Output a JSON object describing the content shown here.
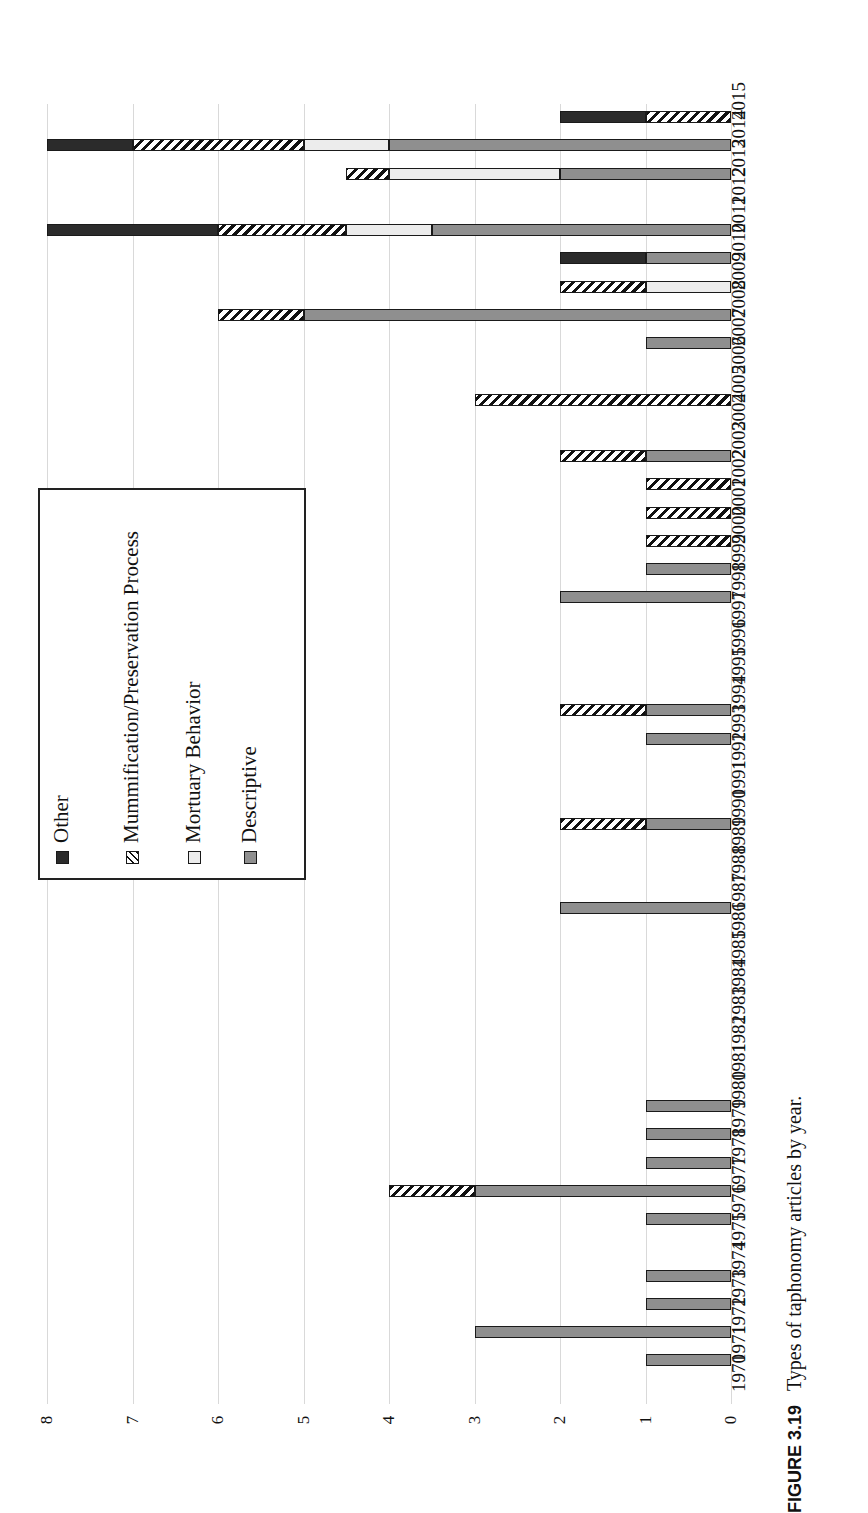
{
  "caption": {
    "figure_number": "FIGURE 3.19",
    "text": "Types of taphonomy articles by year."
  },
  "legend": {
    "items": [
      {
        "label": "Other",
        "key": "other",
        "color": "#2b2b2b"
      },
      {
        "label": "Mummification/Preservation Process",
        "key": "mummification",
        "color": "hatched"
      },
      {
        "label": "Mortuary Behavior",
        "key": "mortuary",
        "color": "#ececec"
      },
      {
        "label": "Descriptive",
        "key": "descriptive",
        "color": "#8f8f8f"
      }
    ]
  },
  "chart_data": {
    "type": "bar",
    "orientation": "horizontal-rotated",
    "title": "Types of taphonomy articles by year",
    "xlabel": "",
    "ylabel": "",
    "xlim": [
      0,
      8
    ],
    "xticks": [
      8,
      7,
      6,
      5,
      4,
      3,
      2,
      1,
      0
    ],
    "grid": true,
    "legend_position": "left-inset-box",
    "categories": [
      "2015",
      "2014",
      "2013",
      "2012",
      "2011",
      "2010",
      "2009",
      "2008",
      "2007",
      "2006",
      "2005",
      "2004",
      "2003",
      "2002",
      "2001",
      "2000",
      "1999",
      "1998",
      "1997",
      "1996",
      "1995",
      "1994",
      "1993",
      "1992",
      "1991",
      "1990",
      "1989",
      "1988",
      "1987",
      "1986",
      "1985",
      "1984",
      "1983",
      "1982",
      "1981",
      "1980",
      "1979",
      "1978",
      "1977",
      "1976",
      "1975",
      "1974",
      "1973",
      "1972",
      "1971",
      "1970"
    ],
    "series": [
      {
        "name": "Descriptive",
        "key": "descriptive",
        "values": [
          0,
          4,
          2,
          0,
          3.5,
          1,
          0,
          5,
          1,
          0,
          0,
          0,
          1,
          0,
          0,
          0,
          1,
          2,
          0,
          0,
          0,
          1,
          1,
          0,
          0,
          1,
          0,
          0,
          2,
          0,
          0,
          0,
          0,
          0,
          0,
          1,
          1,
          1,
          3,
          1,
          0,
          1,
          1,
          3,
          1,
          0
        ]
      },
      {
        "name": "Mortuary Behavior",
        "key": "mortuary",
        "values": [
          0,
          1,
          2,
          0,
          1,
          0,
          1,
          0,
          0,
          0,
          0,
          0,
          0,
          0,
          0,
          0,
          0,
          0,
          0,
          0,
          0,
          0,
          0,
          0,
          0,
          0,
          0,
          0,
          0,
          0,
          0,
          0,
          0,
          0,
          0,
          0,
          0,
          0,
          0,
          0,
          0,
          0,
          0,
          0,
          0,
          0
        ]
      },
      {
        "name": "Mummification/Preservation Process",
        "key": "mummification",
        "values": [
          1,
          2,
          0.5,
          0,
          1.5,
          0,
          1,
          1,
          0,
          0,
          3,
          0,
          1,
          1,
          1,
          1,
          0,
          0,
          0,
          0,
          0,
          1,
          0,
          0,
          0,
          1,
          0,
          0,
          0,
          0,
          0,
          0,
          0,
          0,
          0,
          0,
          0,
          0,
          1,
          0,
          0,
          0,
          0,
          0,
          0,
          0
        ]
      },
      {
        "name": "Other",
        "key": "other",
        "values": [
          1,
          1,
          0,
          0,
          2,
          1,
          0,
          0,
          0,
          0,
          0,
          0,
          0,
          0,
          0,
          0,
          0,
          0,
          0,
          0,
          0,
          0,
          0,
          0,
          0,
          0,
          0,
          0,
          0,
          0,
          0,
          0,
          0,
          0,
          0,
          0,
          0,
          0,
          0,
          0,
          0,
          0,
          0,
          0,
          0,
          0
        ]
      }
    ],
    "totals": [
      2,
      8,
      4.5,
      0,
      8,
      2,
      2,
      6,
      1,
      0,
      3,
      0,
      2,
      1,
      1,
      1,
      1,
      2,
      0,
      0,
      0,
      2,
      1,
      0,
      0,
      2,
      0,
      0,
      2,
      0,
      0,
      0,
      0,
      0,
      0,
      1,
      1,
      1,
      4,
      1,
      0,
      1,
      1,
      3,
      1,
      0
    ]
  }
}
